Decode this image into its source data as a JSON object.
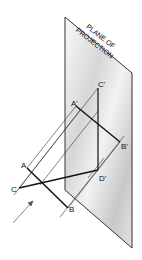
{
  "diagram": {
    "plane": {
      "label_line1": "PLANE OF",
      "label_line2": "PROJECTION",
      "fill_light": "#f4f4f4",
      "fill_dark": "#bdbdbd",
      "edge_color": "#333333"
    },
    "points": {
      "A": "A",
      "B": "B",
      "C": "C",
      "A_prime": "A'",
      "B_prime": "B'",
      "C_prime": "C'",
      "D_prime": "D'"
    },
    "line_color": "#111111",
    "projector_color": "#333333",
    "arrow_label": "direction-of-sight"
  }
}
